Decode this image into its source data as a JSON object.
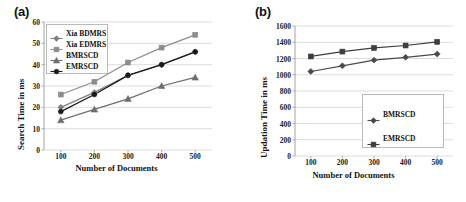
{
  "figure": {
    "panel_a_label": "(a)",
    "panel_b_label": "(b)"
  },
  "chart_data": [
    {
      "id": "a",
      "type": "line",
      "title": "(a)",
      "xlabel": "Number of Documents",
      "ylabel": "Search Time in ms",
      "categories": [
        100,
        200,
        300,
        400,
        500
      ],
      "x": [
        100,
        200,
        300,
        400,
        500
      ],
      "xlim": [
        50,
        550
      ],
      "ylim": [
        0,
        60
      ],
      "ytick_step": 10,
      "yticks": [
        0,
        10,
        20,
        30,
        40,
        50,
        60
      ],
      "xticks": [
        100,
        200,
        300,
        400,
        500
      ],
      "grid": "horizontal",
      "legend_position": "top-left-inside",
      "series": [
        {
          "name": "Xia BDMRS",
          "marker": "diamond",
          "color": "#808080",
          "values": [
            20,
            27,
            35,
            40,
            46
          ]
        },
        {
          "name": "Xia EDMRS",
          "marker": "square",
          "color": "#8c8c8c",
          "values": [
            26,
            32,
            41,
            48,
            54
          ]
        },
        {
          "name": "BMRSCD",
          "marker": "triangle",
          "color": "#6e6e6e",
          "values": [
            14,
            19,
            24,
            30,
            34
          ]
        },
        {
          "name": "EMRSCD",
          "marker": "circle",
          "color": "#1a1a1a",
          "values": [
            18,
            26,
            35,
            40,
            46
          ]
        }
      ]
    },
    {
      "id": "b",
      "type": "line",
      "title": "(b)",
      "xlabel": "Number of Documents",
      "ylabel": "Updation Time in ms",
      "categories": [
        100,
        200,
        300,
        400,
        500
      ],
      "x": [
        100,
        200,
        300,
        400,
        500
      ],
      "xlim": [
        50,
        550
      ],
      "ylim": [
        0,
        1600
      ],
      "ytick_step": 200,
      "yticks": [
        0,
        200,
        400,
        600,
        800,
        1000,
        1200,
        1400,
        1600
      ],
      "xticks": [
        100,
        200,
        300,
        400,
        500
      ],
      "grid": "horizontal",
      "legend_position": "bottom-right-inside",
      "series": [
        {
          "name": "BMRSCD",
          "marker": "diamond",
          "color": "#4a4a4a",
          "values": [
            1040,
            1110,
            1180,
            1215,
            1255
          ]
        },
        {
          "name": "EMRSCD",
          "marker": "square",
          "color": "#3d3d3d",
          "values": [
            1225,
            1285,
            1330,
            1360,
            1405
          ]
        }
      ]
    }
  ],
  "colors": {
    "grid": "#d4d4d4",
    "axis": "#9a9a9a",
    "text": "#111111",
    "background": "#ffffff"
  }
}
